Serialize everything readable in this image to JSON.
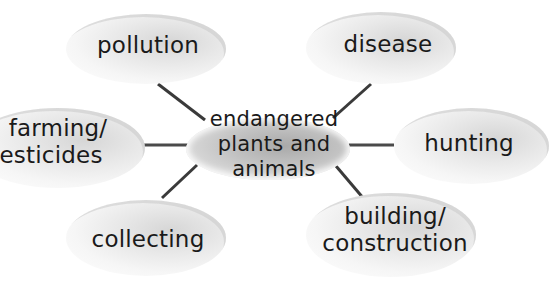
{
  "diagram": {
    "type": "mind-map",
    "center": {
      "lines": [
        "endangered",
        "plants and",
        "animals"
      ]
    },
    "nodes": [
      {
        "id": "pollution",
        "lines": [
          "pollution"
        ]
      },
      {
        "id": "disease",
        "lines": [
          "disease"
        ]
      },
      {
        "id": "farming",
        "lines": [
          "farming/",
          "pesticides"
        ]
      },
      {
        "id": "hunting",
        "lines": [
          "hunting"
        ]
      },
      {
        "id": "collecting",
        "lines": [
          "collecting"
        ]
      },
      {
        "id": "building",
        "lines": [
          "building/",
          "construction"
        ]
      }
    ],
    "colors": {
      "line": "#3a3a3a",
      "bubble": "#e6e6e6",
      "center": "#b5b5b5",
      "text": "#1a1a1a"
    }
  }
}
